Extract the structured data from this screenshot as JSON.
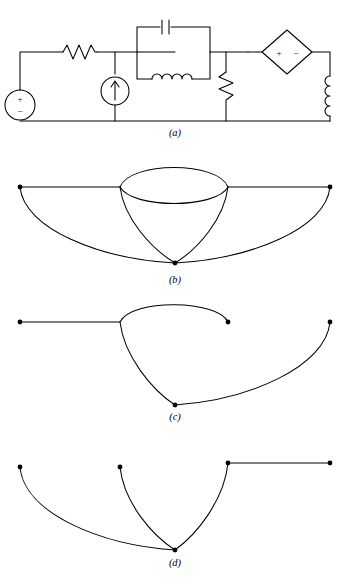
{
  "figure": {
    "background_color": "#ffffff",
    "line_color": "#000000",
    "panels": [
      {
        "id": "a",
        "caption": "(a)",
        "description": "Electrical circuit schematic"
      },
      {
        "id": "b",
        "caption": "(b)",
        "description": "Linear graph of the circuit"
      },
      {
        "id": "c",
        "caption": "(c)",
        "description": "A tree of the graph"
      },
      {
        "id": "d",
        "caption": "(d)",
        "description": "The corresponding cotree"
      }
    ]
  },
  "circuit": {
    "label": "(a)",
    "elements": [
      {
        "name": "independent-voltage-source",
        "type": "voltage-source",
        "shape": "circle",
        "plus": "+",
        "minus": "−",
        "position": "left-branch"
      },
      {
        "name": "series-resistor",
        "type": "resistor",
        "shape": "zigzag",
        "position": "top-left-horizontal"
      },
      {
        "name": "current-source",
        "type": "current-source",
        "shape": "circle-with-arrow",
        "arrow": "↑",
        "position": "second-vertical-branch"
      },
      {
        "name": "capacitor",
        "type": "capacitor",
        "shape": "parallel-plates",
        "position": "tank-top"
      },
      {
        "name": "inductor-tank",
        "type": "inductor",
        "shape": "coil",
        "position": "tank-bottom"
      },
      {
        "name": "shunt-resistor",
        "type": "resistor",
        "shape": "zigzag",
        "position": "middle-right-vertical"
      },
      {
        "name": "dependent-voltage-source",
        "type": "dependent-source",
        "shape": "diamond",
        "plus": "+",
        "minus": "−",
        "position": "top-right-horizontal"
      },
      {
        "name": "output-inductor",
        "type": "inductor",
        "shape": "coil",
        "position": "right-vertical-branch"
      }
    ],
    "source_symbols": {
      "plus": "+",
      "minus": "−",
      "current_arrow": "↑"
    }
  },
  "graph_b": {
    "label": "(b)",
    "node_count": 4,
    "edge_count": 7,
    "nodes": [
      {
        "name": "node-left",
        "x": 20,
        "y": 42
      },
      {
        "name": "node-mid-l",
        "x": 120,
        "y": 42
      },
      {
        "name": "node-mid-r",
        "x": 228,
        "y": 42
      },
      {
        "name": "node-right",
        "x": 330,
        "y": 42
      },
      {
        "name": "node-bottom",
        "x": 175,
        "y": 118
      }
    ],
    "edges": [
      "left-to-midleft-straight",
      "midright-to-right-straight",
      "midleft-to-midright-upper-arc",
      "midleft-to-midright-lower-arc",
      "left-to-bottom-arc",
      "midleft-to-bottom-arc",
      "midright-to-bottom-arc",
      "right-to-bottom-arc"
    ]
  },
  "graph_c": {
    "label": "(c)",
    "description": "Tree: subset of branches containing no loops",
    "nodes": [
      {
        "name": "node-left",
        "x": 20,
        "y": 32
      },
      {
        "name": "node-mid-l",
        "x": 120,
        "y": 32
      },
      {
        "name": "node-mid-r",
        "x": 228,
        "y": 32
      },
      {
        "name": "node-right",
        "x": 330,
        "y": 32
      },
      {
        "name": "node-bottom",
        "x": 175,
        "y": 115
      }
    ],
    "edges": [
      "left-to-midleft-straight",
      "midleft-to-midright-upper-arc",
      "midleft-to-bottom-arc",
      "right-to-bottom-arc"
    ]
  },
  "graph_d": {
    "label": "(d)",
    "description": "Cotree: the complementary set of links",
    "nodes": [
      {
        "name": "node-left",
        "x": 20,
        "y": 32
      },
      {
        "name": "node-mid-l",
        "x": 120,
        "y": 32
      },
      {
        "name": "node-mid-r",
        "x": 228,
        "y": 28
      },
      {
        "name": "node-right",
        "x": 330,
        "y": 28
      },
      {
        "name": "node-bottom",
        "x": 175,
        "y": 115
      }
    ],
    "edges": [
      "left-to-bottom-arc",
      "midleft-to-bottom-arc",
      "midright-to-bottom-arc",
      "midright-to-right-straight"
    ]
  }
}
